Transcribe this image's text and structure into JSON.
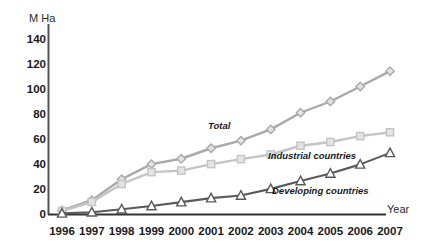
{
  "chart_data": {
    "type": "line",
    "title": "",
    "xlabel": "Year",
    "ylabel": "M Ha",
    "categories": [
      "1996",
      "1997",
      "1998",
      "1999",
      "2000",
      "2001",
      "2002",
      "2003",
      "2004",
      "2005",
      "2006",
      "2007"
    ],
    "x": [
      1996,
      1997,
      1998,
      1999,
      2000,
      2001,
      2002,
      2003,
      2004,
      2005,
      2006,
      2007
    ],
    "xlim": [
      1996,
      2007
    ],
    "ylim": [
      0,
      150
    ],
    "y_ticks": [
      "0",
      "20",
      "40",
      "60",
      "80",
      "100",
      "120",
      "140"
    ],
    "y_tick_values": [
      0,
      20,
      40,
      60,
      80,
      100,
      120,
      140
    ],
    "grid": false,
    "legend_position": "inline-annotations",
    "series": [
      {
        "name": "Total",
        "marker": "diamond",
        "color": "#a9a9a9",
        "values": [
          2.8,
          11.0,
          27.8,
          39.9,
          44.2,
          52.6,
          58.7,
          67.7,
          81.0,
          90.0,
          102.0,
          114.3
        ]
      },
      {
        "name": "Industrial countries",
        "marker": "square",
        "color": "#c4c4c4",
        "values": [
          2.4,
          9.6,
          24.0,
          33.5,
          34.7,
          39.9,
          43.9,
          47.6,
          54.6,
          57.6,
          62.3,
          65.4
        ]
      },
      {
        "name": "Developing countries",
        "marker": "triangle",
        "color": "#5a5a5a",
        "values": [
          0.5,
          1.4,
          3.8,
          6.4,
          9.5,
          12.7,
          14.8,
          20.1,
          26.4,
          32.4,
          39.7,
          48.9
        ]
      }
    ],
    "annotations": [
      {
        "text": "Total",
        "series": "Total"
      },
      {
        "text": "Industrial countries",
        "series": "Industrial countries"
      },
      {
        "text": "Developing countries",
        "series": "Developing countries"
      }
    ]
  }
}
